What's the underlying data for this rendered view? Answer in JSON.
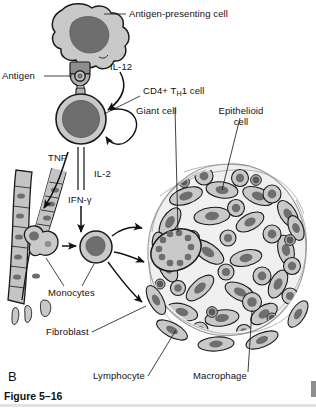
{
  "figure": {
    "panel_letter": "B",
    "caption": "Figure 5–16"
  },
  "labels": {
    "antigen_presenting_cell": "Antigen-presenting cell",
    "antigen": "Antigen",
    "il12": "IL-12",
    "cd4_th1_prefix": "CD4+ T",
    "cd4_th1_sub": "H",
    "cd4_th1_suffix": "1 cell",
    "giant_cell": "Giant cell",
    "epithelioid_line1": "Epithelioid",
    "epithelioid_line2": "cell",
    "tnf": "TNF",
    "il2": "IL-2",
    "ifn_gamma": "IFN-γ",
    "monocytes": "Monocytes",
    "fibroblast": "Fibroblast",
    "lymphocyte": "Lymphocyte",
    "macrophage": "Macrophage"
  },
  "colors": {
    "background": "#ffffff",
    "outline": "#1a1a1a",
    "cytoplasm_light": "#c9c9c9",
    "cytoplasm_mid": "#b0b0b0",
    "nucleus_dark": "#6e6e6e",
    "nucleus_darker": "#5a5a5a",
    "vessel_fill": "#c4c4c4",
    "capsule": "#d8d8d8",
    "text": "#111111",
    "rule": "#e2e2e2",
    "edge_mark": "#8e8e8e"
  },
  "diagram": {
    "type": "biological-schematic",
    "cell_types": [
      "antigen-presenting cell",
      "CD4+ TH1 cell",
      "monocyte",
      "macrophage",
      "epithelioid cell",
      "multinucleated giant cell",
      "lymphocyte",
      "fibroblast",
      "endothelial cell"
    ],
    "cytokines": [
      "IL-12",
      "IL-2",
      "TNF",
      "IFN-γ"
    ],
    "granuloma": {
      "center_x": 228,
      "center_y": 250,
      "radius_x": 84,
      "radius_y": 86
    }
  }
}
